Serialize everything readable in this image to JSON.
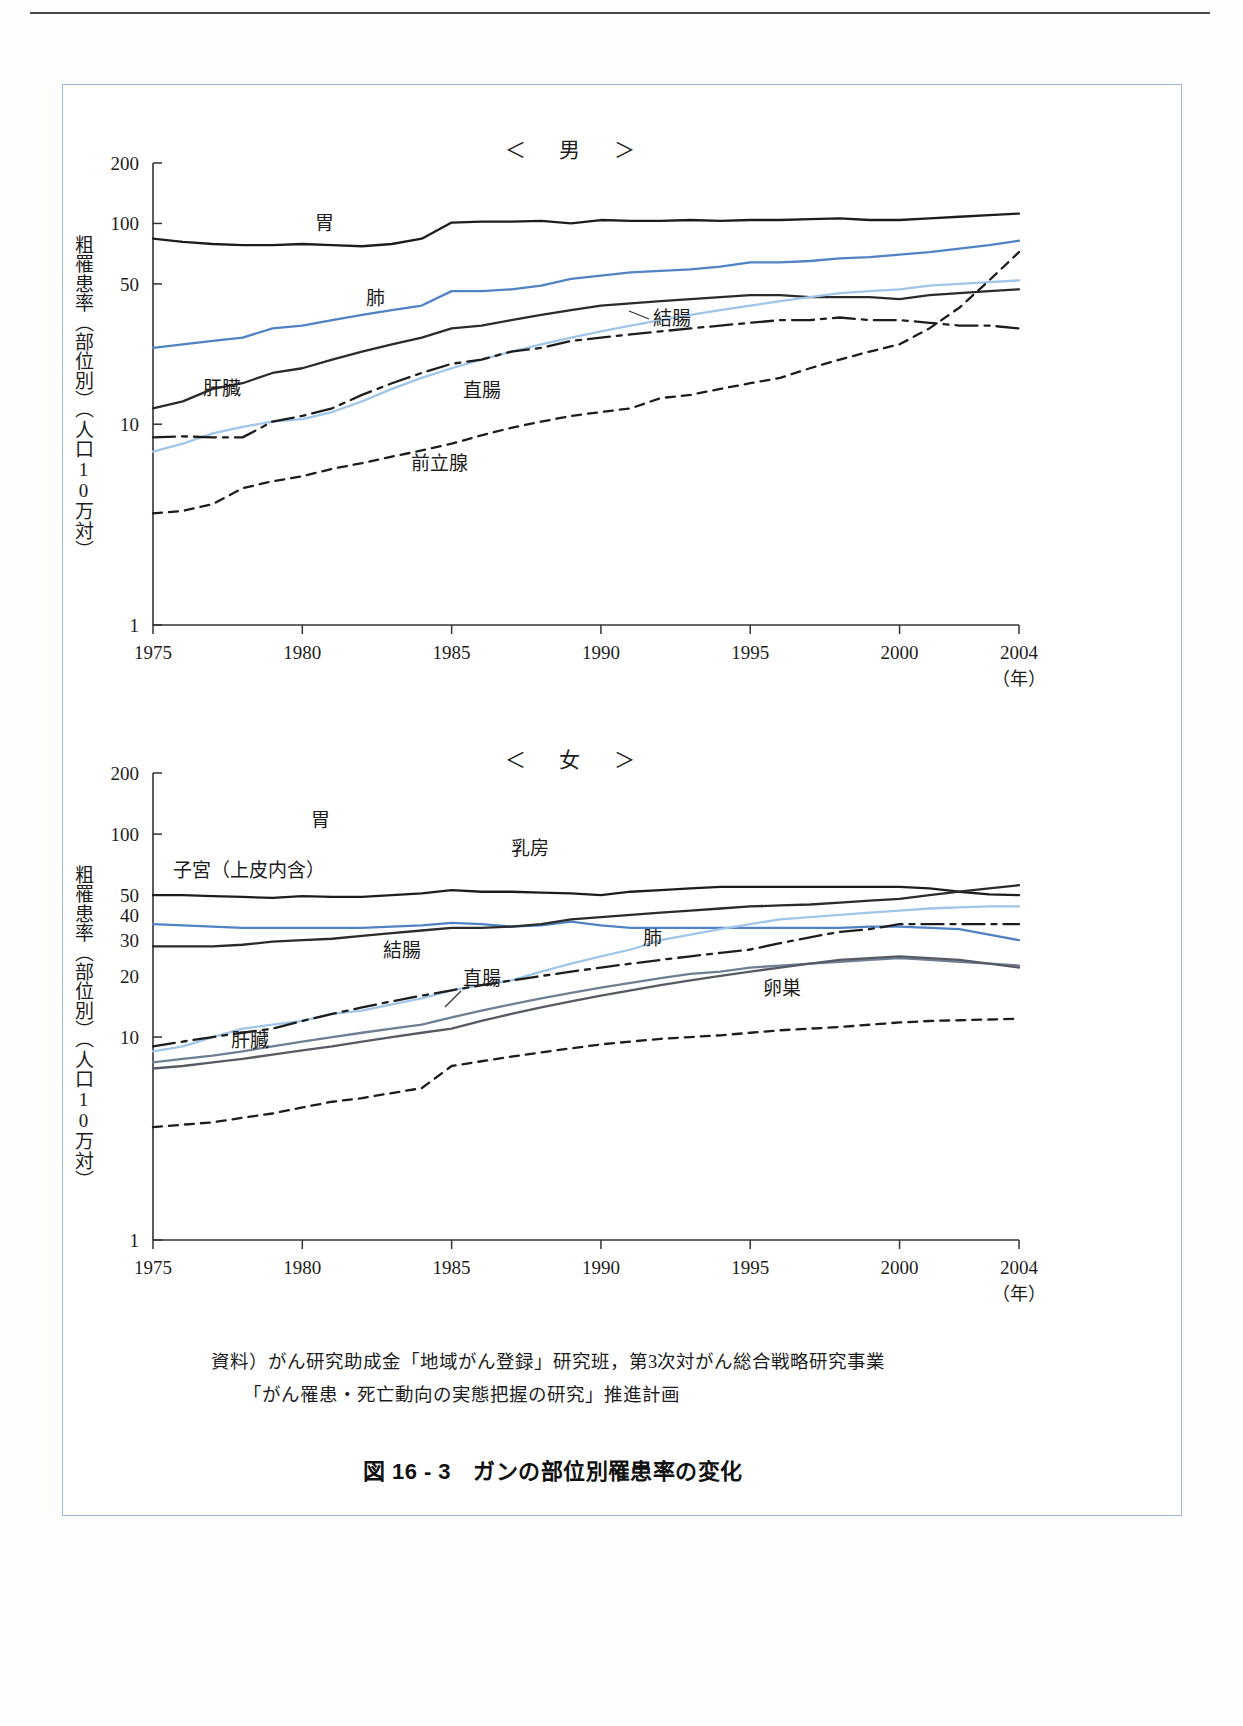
{
  "figure": {
    "caption": "図 16 - 3　ガンの部位別罹患率の変化",
    "source_line1": "資料）がん研究助成金「地域がん登録」研究班，第3次対がん総合戦略研究事業",
    "source_line2": "「がん罹患・死亡動向の実態把握の研究」推進計画"
  },
  "chart_data": [
    {
      "type": "line",
      "title": "＜　男　＞",
      "xlabel": "（年）",
      "ylabel": "粗罹患率（部位別）（人口10万対）",
      "yscale": "log",
      "ylim": [
        1,
        200
      ],
      "yticks": [
        1,
        10,
        50,
        100,
        200
      ],
      "xlim": [
        1975,
        2004
      ],
      "xticks": [
        1975,
        1980,
        1985,
        1990,
        1995,
        2000,
        2004
      ],
      "xtick_labels": [
        "1975",
        "1980",
        "1985",
        "1990",
        "1995",
        "2000",
        "2004"
      ],
      "grid": false,
      "legend": "inline-labels",
      "x": [
        1975,
        1976,
        1977,
        1978,
        1979,
        1980,
        1981,
        1982,
        1983,
        1984,
        1985,
        1986,
        1987,
        1988,
        1989,
        1990,
        1991,
        1992,
        1993,
        1994,
        1995,
        1996,
        1997,
        1998,
        1999,
        2000,
        2001,
        2002,
        2003,
        2004
      ],
      "series": [
        {
          "name": "胃",
          "label": "胃",
          "color": "#1d1d1d",
          "style": "solid",
          "values": [
            84,
            81,
            79,
            78,
            78,
            79,
            78,
            77,
            79,
            84,
            101,
            102,
            102,
            103,
            100,
            104,
            103,
            103,
            104,
            103,
            104,
            104,
            105,
            106,
            104,
            104,
            106,
            108,
            110,
            112
          ]
        },
        {
          "name": "肺",
          "label": "肺",
          "color": "#4f83c4",
          "style": "solid",
          "values": [
            24,
            25,
            26,
            27,
            30,
            31,
            33,
            35,
            37,
            39,
            46,
            46,
            47,
            49,
            53,
            55,
            57,
            58,
            59,
            61,
            64,
            64,
            65,
            67,
            68,
            70,
            72,
            75,
            78,
            82
          ]
        },
        {
          "name": "肝臓",
          "label": "肝臓",
          "color": "#2b2b2b",
          "style": "solid",
          "values": [
            12,
            13,
            15,
            16,
            18,
            19,
            21,
            23,
            25,
            27,
            30,
            31,
            33,
            35,
            37,
            39,
            40,
            41,
            42,
            43,
            44,
            44,
            43,
            43,
            43,
            42,
            44,
            45,
            46,
            47
          ]
        },
        {
          "name": "結腸",
          "label": "結腸",
          "color": "#9fc6e8",
          "style": "solid",
          "values": [
            7.3,
            8.0,
            9.0,
            9.7,
            10.3,
            10.6,
            11.5,
            13,
            15,
            17,
            19,
            21,
            23,
            25,
            27,
            29,
            31,
            33,
            35,
            37,
            39,
            41,
            43,
            45,
            46,
            47,
            49,
            50,
            51,
            52
          ]
        },
        {
          "name": "直腸",
          "label": "直腸",
          "color": "#1d1d1d",
          "style": "dashdot",
          "values": [
            8.6,
            8.7,
            8.6,
            8.6,
            10.3,
            11,
            12,
            14,
            16,
            18,
            20,
            21,
            23,
            24,
            26,
            27,
            28,
            29,
            30,
            31,
            32,
            33,
            33,
            34,
            33,
            33,
            32,
            31,
            31,
            30
          ]
        },
        {
          "name": "前立腺",
          "label": "前立腺",
          "color": "#1d1d1d",
          "style": "dashed",
          "values": [
            3.6,
            3.7,
            4.0,
            4.8,
            5.2,
            5.5,
            6.0,
            6.4,
            6.9,
            7.4,
            8.0,
            8.8,
            9.6,
            10.3,
            11,
            11.5,
            12,
            13.5,
            14,
            15,
            16,
            17,
            19,
            21,
            23,
            25,
            30,
            38,
            52,
            72
          ]
        }
      ]
    },
    {
      "type": "line",
      "title": "＜　女　＞",
      "xlabel": "（年）",
      "ylabel": "粗罹患率（部位別）（人口10万対）",
      "yscale": "log",
      "ylim": [
        1,
        200
      ],
      "yticks": [
        1,
        10,
        20,
        30,
        40,
        50,
        100,
        200
      ],
      "ytick_major": [
        1,
        10,
        50,
        100,
        200
      ],
      "xlim": [
        1975,
        2004
      ],
      "xticks": [
        1975,
        1980,
        1985,
        1990,
        1995,
        2000,
        2004
      ],
      "xtick_labels": [
        "1975",
        "1980",
        "1985",
        "1990",
        "1995",
        "2000",
        "2004"
      ],
      "grid": false,
      "legend": "inline-labels",
      "x": [
        1975,
        1976,
        1977,
        1978,
        1979,
        1980,
        1981,
        1982,
        1983,
        1984,
        1985,
        1986,
        1987,
        1988,
        1989,
        1990,
        1991,
        1992,
        1993,
        1994,
        1995,
        1996,
        1997,
        1998,
        1999,
        2000,
        2001,
        2002,
        2003,
        2004
      ],
      "series": [
        {
          "name": "胃",
          "label": "胃",
          "color": "#1d1d1d",
          "style": "solid",
          "values": [
            50,
            50,
            49.5,
            49,
            48.5,
            49.5,
            49,
            49,
            50,
            51,
            53,
            52,
            52,
            51.5,
            51,
            50,
            52,
            53,
            54,
            55,
            55,
            55,
            55,
            55,
            55,
            55,
            54,
            52,
            50.5,
            50
          ]
        },
        {
          "name": "子宮（上皮内含）",
          "label": "子宮（上皮内含）",
          "color": "#4f83c4",
          "style": "solid",
          "values": [
            36,
            35.5,
            35,
            34.5,
            34.5,
            34.5,
            34.5,
            34.5,
            35,
            35.5,
            36.5,
            36,
            35,
            35.5,
            37,
            35.5,
            34.5,
            34.5,
            34.5,
            34.5,
            34.5,
            34.5,
            34.5,
            34.5,
            35,
            35,
            34.5,
            34,
            32,
            30
          ]
        },
        {
          "name": "乳房",
          "label": "乳房",
          "color": "#2b2b2b",
          "style": "solid",
          "values": [
            28,
            28,
            28,
            28.5,
            29.5,
            30,
            30.5,
            31.5,
            32.5,
            33.5,
            34.5,
            34.5,
            35,
            36,
            38,
            39,
            40,
            41,
            42,
            43,
            44,
            44.5,
            45,
            46,
            47,
            48,
            50,
            52,
            54,
            56
          ]
        },
        {
          "name": "結腸",
          "label": "結腸",
          "color": "#9fc6e8",
          "style": "solid",
          "values": [
            8.5,
            9,
            10,
            11,
            11.5,
            12,
            13,
            13.5,
            14.5,
            15.5,
            17,
            18,
            19,
            21,
            23,
            25,
            27,
            30,
            32,
            34,
            36,
            38,
            39,
            40,
            41,
            42,
            43,
            43.5,
            44,
            44
          ]
        },
        {
          "name": "肺",
          "label": "肺",
          "color": "#1d1d1d",
          "style": "dashdot",
          "values": [
            9,
            9.5,
            10,
            10.5,
            11,
            12,
            13,
            14,
            15,
            16,
            17,
            18,
            19,
            20,
            21,
            22,
            23,
            24,
            25,
            26,
            27,
            29,
            31,
            33,
            34,
            36,
            36,
            36,
            36,
            36
          ]
        },
        {
          "name": "直腸",
          "label": "直腸",
          "color": "#6e7f94",
          "style": "solid",
          "values": [
            7.5,
            7.8,
            8.1,
            8.5,
            9,
            9.5,
            10,
            10.5,
            11,
            11.5,
            12.5,
            13.5,
            14.5,
            15.5,
            16.5,
            17.5,
            18.5,
            19.5,
            20.5,
            21,
            22,
            22.5,
            23,
            23.5,
            24,
            24.5,
            24,
            23.5,
            23,
            22.5
          ]
        },
        {
          "name": "肝臓",
          "label": "肝臓",
          "color": "#565b63",
          "style": "solid",
          "values": [
            7,
            7.2,
            7.5,
            7.8,
            8.2,
            8.6,
            9,
            9.5,
            10,
            10.5,
            11,
            12,
            13,
            14,
            15,
            16,
            17,
            18,
            19,
            20,
            21,
            22,
            23,
            24,
            24.5,
            25,
            24.5,
            24,
            23,
            22
          ]
        },
        {
          "name": "卵巣",
          "label": "卵巣",
          "color": "#1d1d1d",
          "style": "dashed",
          "values": [
            3.6,
            3.7,
            3.8,
            4.0,
            4.2,
            4.5,
            4.8,
            5.0,
            5.3,
            5.6,
            7.2,
            7.6,
            8.0,
            8.4,
            8.8,
            9.2,
            9.5,
            9.8,
            10,
            10.2,
            10.5,
            10.8,
            11,
            11.2,
            11.5,
            11.8,
            12,
            12.1,
            12.2,
            12.3
          ]
        }
      ]
    }
  ]
}
